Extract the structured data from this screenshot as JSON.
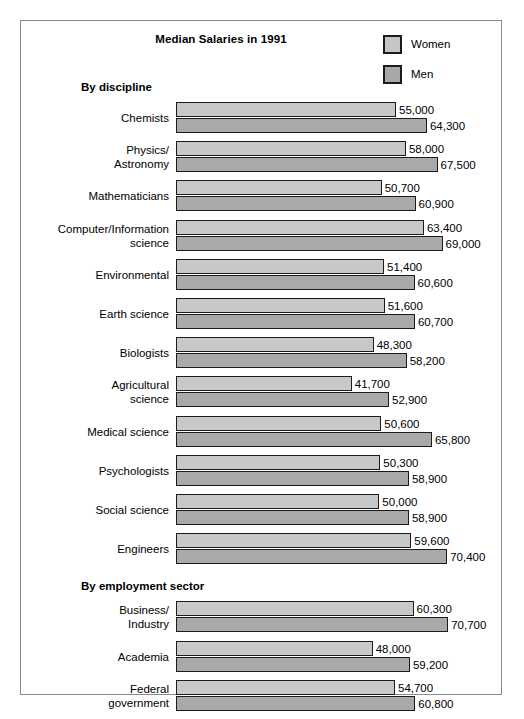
{
  "chart_data": {
    "type": "bar",
    "title": "Median Salaries in 1991",
    "orientation": "horizontal",
    "grouped": true,
    "xlabel": "",
    "ylabel": "",
    "xlim": [
      0,
      75000
    ],
    "grid": false,
    "legend_position": "top-right",
    "legend": [
      {
        "name": "Women",
        "color": "#c8c8c8"
      },
      {
        "name": "Men",
        "color": "#a9a9a9"
      }
    ],
    "series": [
      {
        "name": "Women",
        "values": [
          55000,
          58000,
          50700,
          63400,
          51400,
          51600,
          48300,
          41700,
          50600,
          50300,
          50000,
          59600,
          60300,
          48000,
          54700,
          46000
        ]
      },
      {
        "name": "Men",
        "values": [
          64300,
          67500,
          60900,
          69000,
          60600,
          60700,
          58200,
          52900,
          65800,
          58900,
          58900,
          70400,
          70700,
          59200,
          60800,
          58700
        ]
      }
    ],
    "categories": [
      "Chemists",
      "Physics/ Astronomy",
      "Mathematicians",
      "Computer/Information science",
      "Environmental",
      "Earth science",
      "Biologists",
      "Agricultural science",
      "Medical science",
      "Psychologists",
      "Social science",
      "Engineers",
      "Business/ Industry",
      "Academia",
      "Federal government",
      "Nonprofits"
    ],
    "value_labels": [
      "55,000",
      "64,300",
      "58,000",
      "67,500",
      "50,700",
      "60,900",
      "63,400",
      "69,000",
      "51,400",
      "60,600",
      "51,600",
      "60,700",
      "48,300",
      "58,200",
      "41,700",
      "52,900",
      "50,600",
      "65,800",
      "50,300",
      "58,900",
      "50,000",
      "58,900",
      "59,600",
      "70,400",
      "60,300",
      "70,700",
      "48,000",
      "59,200",
      "54,700",
      "60,800",
      "46,000",
      "58,700"
    ]
  },
  "sections": [
    {
      "header": "By discipline",
      "rows": [
        {
          "label_lines": [
            "Chemists"
          ],
          "women": 55000,
          "men": 64300,
          "women_label": "55,000",
          "men_label": "64,300"
        },
        {
          "label_lines": [
            "Physics/",
            "Astronomy"
          ],
          "women": 58000,
          "men": 67500,
          "women_label": "58,000",
          "men_label": "67,500"
        },
        {
          "label_lines": [
            "Mathematicians"
          ],
          "women": 50700,
          "men": 60900,
          "women_label": "50,700",
          "men_label": "60,900"
        },
        {
          "label_lines": [
            "Computer/Information",
            "science"
          ],
          "women": 63400,
          "men": 69000,
          "women_label": "63,400",
          "men_label": "69,000"
        },
        {
          "label_lines": [
            "Environmental"
          ],
          "women": 51400,
          "men": 60600,
          "women_label": "51,400",
          "men_label": "60,600"
        },
        {
          "label_lines": [
            "Earth science"
          ],
          "women": 51600,
          "men": 60700,
          "women_label": "51,600",
          "men_label": "60,700"
        },
        {
          "label_lines": [
            "Biologists"
          ],
          "women": 48300,
          "men": 58200,
          "women_label": "48,300",
          "men_label": "58,200"
        },
        {
          "label_lines": [
            "Agricultural",
            "science"
          ],
          "women": 41700,
          "men": 52900,
          "women_label": "41,700",
          "men_label": "52,900"
        },
        {
          "label_lines": [
            "Medical science"
          ],
          "women": 50600,
          "men": 65800,
          "women_label": "50,600",
          "men_label": "65,800"
        },
        {
          "label_lines": [
            "Psychologists"
          ],
          "women": 50300,
          "men": 58900,
          "women_label": "50,300",
          "men_label": "58,900"
        },
        {
          "label_lines": [
            "Social science"
          ],
          "women": 50000,
          "men": 58900,
          "women_label": "50,000",
          "men_label": "58,900"
        },
        {
          "label_lines": [
            "Engineers"
          ],
          "women": 59600,
          "men": 70400,
          "women_label": "59,600",
          "men_label": "70,400"
        }
      ]
    },
    {
      "header": "By employment sector",
      "rows": [
        {
          "label_lines": [
            "Business/",
            "Industry"
          ],
          "women": 60300,
          "men": 70700,
          "women_label": "60,300",
          "men_label": "70,700"
        },
        {
          "label_lines": [
            "Academia"
          ],
          "women": 48000,
          "men": 59200,
          "women_label": "48,000",
          "men_label": "59,200"
        },
        {
          "label_lines": [
            "Federal",
            "government"
          ],
          "women": 54700,
          "men": 60800,
          "women_label": "54,700",
          "men_label": "60,800"
        },
        {
          "label_lines": [
            "Nonprofits"
          ],
          "women": 46000,
          "men": 58700,
          "women_label": "46,000",
          "men_label": "58,700"
        }
      ]
    }
  ],
  "title": "Median Salaries in 1991",
  "legend": {
    "women_label": "Women",
    "men_label": "Men"
  },
  "colors": {
    "women_fill": "#c8c8c8",
    "men_fill": "#a9a9a9",
    "bar_stroke": "#1b1b1b",
    "frame": "#8a8a8a"
  }
}
